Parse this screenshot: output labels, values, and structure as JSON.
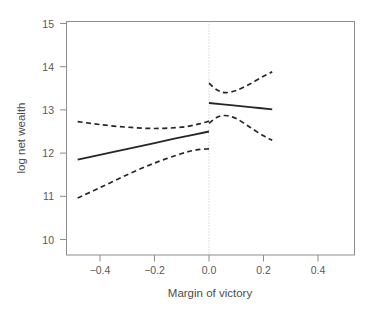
{
  "chart_data": {
    "type": "line",
    "title": "",
    "subtitle": "",
    "xlabel": "Margin of victory",
    "ylabel": "log net wealth",
    "xlim": [
      -0.55,
      0.54
    ],
    "ylim": [
      9.85,
      15.2
    ],
    "xticks": [
      -0.4,
      -0.2,
      0.0,
      0.2,
      0.4
    ],
    "xticklabels": [
      "−0.4",
      "−0.2",
      "0.0",
      "0.2",
      "0.4"
    ],
    "yticks": [
      10,
      11,
      12,
      13,
      14,
      15
    ],
    "yticklabels": [
      "10",
      "11",
      "12",
      "13",
      "14",
      "15"
    ],
    "grid": false,
    "legend": null,
    "annotations": [
      {
        "name": "cutoff-line",
        "type": "vertical-dotted-line",
        "x": 0.0
      }
    ],
    "series": [
      {
        "name": "fit-left",
        "style": "solid",
        "x": [
          -0.482,
          -0.35,
          -0.2,
          -0.1,
          0.0
        ],
        "values": [
          11.85,
          12.03,
          12.23,
          12.37,
          12.5
        ]
      },
      {
        "name": "ci-upper-left",
        "style": "dashed",
        "x": [
          -0.482,
          -0.4,
          -0.3,
          -0.2,
          -0.1,
          -0.04,
          0.0
        ],
        "values": [
          12.73,
          12.66,
          12.6,
          12.57,
          12.6,
          12.67,
          12.74
        ]
      },
      {
        "name": "ci-lower-left",
        "style": "dashed",
        "x": [
          -0.482,
          -0.4,
          -0.3,
          -0.2,
          -0.1,
          -0.05,
          0.0
        ],
        "values": [
          10.96,
          11.2,
          11.5,
          11.77,
          11.99,
          12.07,
          12.1
        ]
      },
      {
        "name": "fit-right",
        "style": "solid",
        "x": [
          0.0,
          0.08,
          0.16,
          0.232
        ],
        "values": [
          13.16,
          13.11,
          13.06,
          13.01
        ]
      },
      {
        "name": "ci-upper-right",
        "style": "dashed",
        "x": [
          0.0,
          0.03,
          0.06,
          0.1,
          0.15,
          0.2,
          0.232
        ],
        "values": [
          13.62,
          13.46,
          13.4,
          13.45,
          13.6,
          13.78,
          13.88
        ]
      },
      {
        "name": "ci-lower-right",
        "style": "dashed",
        "x": [
          0.0,
          0.03,
          0.06,
          0.1,
          0.15,
          0.2,
          0.232
        ],
        "values": [
          12.69,
          12.83,
          12.87,
          12.8,
          12.6,
          12.4,
          12.3
        ]
      }
    ]
  }
}
